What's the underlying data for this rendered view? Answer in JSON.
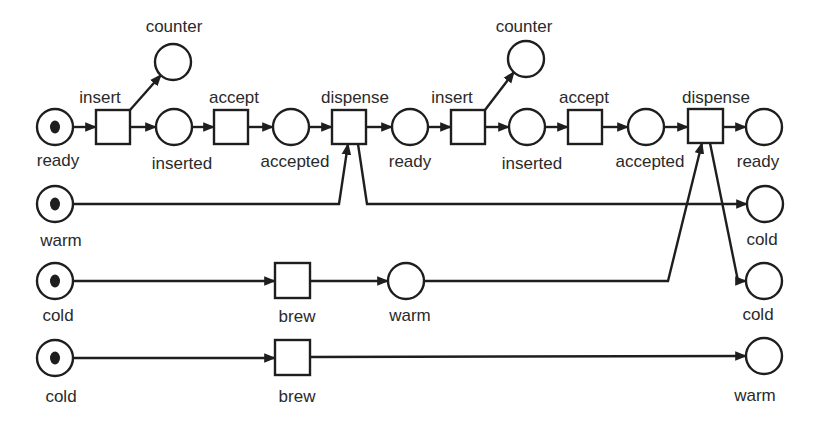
{
  "diagram": {
    "type": "petri-net",
    "colors": {
      "stroke": "#1e1e1e",
      "token": "#1e1e1e",
      "background": "#ffffff",
      "text": "#2a2a2a"
    },
    "places": [
      {
        "id": "p_ready1",
        "label": "ready",
        "cx": 55,
        "cy": 127,
        "tokens": 1,
        "lx": 58,
        "ly": 152
      },
      {
        "id": "p_counter1",
        "label": "counter",
        "cx": 173,
        "cy": 62,
        "tokens": 0,
        "lx": 174,
        "ly": 18
      },
      {
        "id": "p_inserted1",
        "label": "inserted",
        "cx": 174,
        "cy": 127,
        "tokens": 0,
        "lx": 182,
        "ly": 155
      },
      {
        "id": "p_accepted1",
        "label": "accepted",
        "cx": 291,
        "cy": 127,
        "tokens": 0,
        "lx": 295,
        "ly": 153
      },
      {
        "id": "p_ready2",
        "label": "ready",
        "cx": 410,
        "cy": 127,
        "tokens": 0,
        "lx": 410,
        "ly": 153
      },
      {
        "id": "p_counter2",
        "label": "counter",
        "cx": 526,
        "cy": 59,
        "tokens": 0,
        "lx": 524,
        "ly": 18
      },
      {
        "id": "p_inserted2",
        "label": "inserted",
        "cx": 527,
        "cy": 127,
        "tokens": 0,
        "lx": 532,
        "ly": 155
      },
      {
        "id": "p_accepted2",
        "label": "accepted",
        "cx": 646,
        "cy": 127,
        "tokens": 0,
        "lx": 650,
        "ly": 153
      },
      {
        "id": "p_ready3",
        "label": "ready",
        "cx": 764,
        "cy": 127,
        "tokens": 0,
        "lx": 758,
        "ly": 153
      },
      {
        "id": "p_warm1",
        "label": "warm",
        "cx": 55,
        "cy": 204,
        "tokens": 1,
        "lx": 61,
        "ly": 232
      },
      {
        "id": "p_cold_out1",
        "label": "cold",
        "cx": 765,
        "cy": 204,
        "tokens": 0,
        "lx": 762,
        "ly": 231
      },
      {
        "id": "p_cold1",
        "label": "cold",
        "cx": 55,
        "cy": 281,
        "tokens": 1,
        "lx": 58,
        "ly": 307
      },
      {
        "id": "p_warm_mid",
        "label": "warm",
        "cx": 406,
        "cy": 281,
        "tokens": 0,
        "lx": 410,
        "ly": 307
      },
      {
        "id": "p_cold_out2",
        "label": "cold",
        "cx": 764,
        "cy": 281,
        "tokens": 0,
        "lx": 758,
        "ly": 306
      },
      {
        "id": "p_cold2",
        "label": "cold",
        "cx": 55,
        "cy": 358,
        "tokens": 1,
        "lx": 61,
        "ly": 388
      },
      {
        "id": "p_warm_out",
        "label": "warm",
        "cx": 764,
        "cy": 356,
        "tokens": 0,
        "lx": 755,
        "ly": 387
      }
    ],
    "place_radius": 18,
    "transitions": [
      {
        "id": "t_insert1",
        "label": "insert",
        "x": 96,
        "y": 110,
        "w": 34,
        "h": 34,
        "lx": 100,
        "ly": 89,
        "label_pos": "above"
      },
      {
        "id": "t_accept1",
        "label": "accept",
        "x": 214,
        "y": 110,
        "w": 34,
        "h": 34,
        "lx": 234,
        "ly": 89,
        "label_pos": "above"
      },
      {
        "id": "t_dispense1",
        "label": "dispense",
        "x": 332,
        "y": 110,
        "w": 34,
        "h": 34,
        "lx": 355,
        "ly": 89,
        "label_pos": "above"
      },
      {
        "id": "t_insert2",
        "label": "insert",
        "x": 451,
        "y": 110,
        "w": 34,
        "h": 34,
        "lx": 452,
        "ly": 89,
        "label_pos": "above"
      },
      {
        "id": "t_accept2",
        "label": "accept",
        "x": 568,
        "y": 110,
        "w": 34,
        "h": 34,
        "lx": 584,
        "ly": 89,
        "label_pos": "above"
      },
      {
        "id": "t_dispense2",
        "label": "dispense",
        "x": 688,
        "y": 109,
        "w": 35,
        "h": 34,
        "lx": 716,
        "ly": 89,
        "label_pos": "above"
      },
      {
        "id": "t_brew1",
        "label": "brew",
        "x": 275,
        "y": 263,
        "w": 35,
        "h": 35,
        "lx": 297,
        "ly": 308,
        "label_pos": "below"
      },
      {
        "id": "t_brew2",
        "label": "brew",
        "x": 275,
        "y": 340,
        "w": 35,
        "h": 35,
        "lx": 297,
        "ly": 388,
        "label_pos": "below"
      }
    ],
    "arcs": [
      {
        "from": "p_ready1",
        "to": "t_insert1",
        "points": [
          [
            73,
            127
          ],
          [
            96,
            127
          ]
        ]
      },
      {
        "from": "t_insert1",
        "to": "p_counter1",
        "points": [
          [
            130,
            110
          ],
          [
            161,
            75
          ]
        ]
      },
      {
        "from": "t_insert1",
        "to": "p_inserted1",
        "points": [
          [
            130,
            127
          ],
          [
            156,
            127
          ]
        ]
      },
      {
        "from": "p_inserted1",
        "to": "t_accept1",
        "points": [
          [
            192,
            127
          ],
          [
            214,
            127
          ]
        ]
      },
      {
        "from": "t_accept1",
        "to": "p_accepted1",
        "points": [
          [
            248,
            127
          ],
          [
            273,
            127
          ]
        ]
      },
      {
        "from": "p_accepted1",
        "to": "t_dispense1",
        "points": [
          [
            309,
            127
          ],
          [
            332,
            127
          ]
        ]
      },
      {
        "from": "t_dispense1",
        "to": "p_ready2",
        "points": [
          [
            366,
            127
          ],
          [
            392,
            127
          ]
        ]
      },
      {
        "from": "p_ready2",
        "to": "t_insert2",
        "points": [
          [
            428,
            127
          ],
          [
            451,
            127
          ]
        ]
      },
      {
        "from": "t_insert2",
        "to": "p_counter2",
        "points": [
          [
            485,
            110
          ],
          [
            514,
            72
          ]
        ]
      },
      {
        "from": "t_insert2",
        "to": "p_inserted2",
        "points": [
          [
            485,
            127
          ],
          [
            509,
            127
          ]
        ]
      },
      {
        "from": "p_inserted2",
        "to": "t_accept2",
        "points": [
          [
            545,
            127
          ],
          [
            568,
            127
          ]
        ]
      },
      {
        "from": "t_accept2",
        "to": "p_accepted2",
        "points": [
          [
            602,
            127
          ],
          [
            628,
            127
          ]
        ]
      },
      {
        "from": "p_accepted2",
        "to": "t_dispense2",
        "points": [
          [
            664,
            127
          ],
          [
            688,
            127
          ]
        ]
      },
      {
        "from": "t_dispense2",
        "to": "p_ready3",
        "points": [
          [
            723,
            127
          ],
          [
            746,
            127
          ]
        ]
      },
      {
        "from": "p_warm1",
        "to": "t_dispense1",
        "points": [
          [
            73,
            204
          ],
          [
            339,
            204
          ],
          [
            348,
            144
          ]
        ]
      },
      {
        "from": "t_dispense1",
        "to": "p_cold_out1",
        "points": [
          [
            358,
            144
          ],
          [
            367,
            204
          ],
          [
            747,
            204
          ]
        ]
      },
      {
        "from": "p_cold1",
        "to": "t_brew1",
        "points": [
          [
            73,
            281
          ],
          [
            275,
            281
          ]
        ]
      },
      {
        "from": "t_brew1",
        "to": "p_warm_mid",
        "points": [
          [
            310,
            281
          ],
          [
            388,
            281
          ]
        ]
      },
      {
        "from": "p_warm_mid",
        "to": "t_dispense2",
        "points": [
          [
            424,
            281
          ],
          [
            668,
            281
          ],
          [
            702,
            143
          ]
        ]
      },
      {
        "from": "t_dispense2",
        "to": "p_cold_out2",
        "points": [
          [
            710,
            143
          ],
          [
            738,
            281
          ],
          [
            746,
            281
          ]
        ]
      },
      {
        "from": "p_cold2",
        "to": "t_brew2",
        "points": [
          [
            73,
            358
          ],
          [
            275,
            358
          ]
        ]
      },
      {
        "from": "t_brew2",
        "to": "p_warm_out",
        "points": [
          [
            310,
            357
          ],
          [
            746,
            356
          ]
        ]
      }
    ]
  }
}
